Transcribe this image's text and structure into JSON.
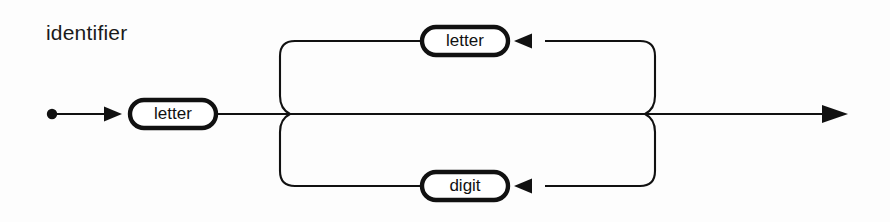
{
  "diagram": {
    "kind": "railroad-syntax-diagram",
    "title": "identifier",
    "stroke_color": "#111111",
    "background_color": "#fdfdfd",
    "start_marker": "start-dot",
    "end_marker": "arrow-right",
    "nodes": [
      {
        "id": "main-letter",
        "label": "letter",
        "type": "terminal-box",
        "track": "main",
        "description": "first character of identifier"
      },
      {
        "id": "loop-letter",
        "label": "letter",
        "type": "terminal-box",
        "track": "upper-loop",
        "description": "repeatable letter"
      },
      {
        "id": "loop-digit",
        "label": "digit",
        "type": "terminal-box",
        "track": "lower-loop",
        "description": "repeatable digit"
      }
    ],
    "arrows": [
      {
        "id": "entry-arrow",
        "direction": "right",
        "track": "main"
      },
      {
        "id": "upper-loop-arrow",
        "direction": "left",
        "track": "upper-loop"
      },
      {
        "id": "lower-loop-arrow",
        "direction": "left",
        "track": "lower-loop"
      },
      {
        "id": "exit-arrow",
        "direction": "right",
        "track": "main"
      }
    ]
  }
}
